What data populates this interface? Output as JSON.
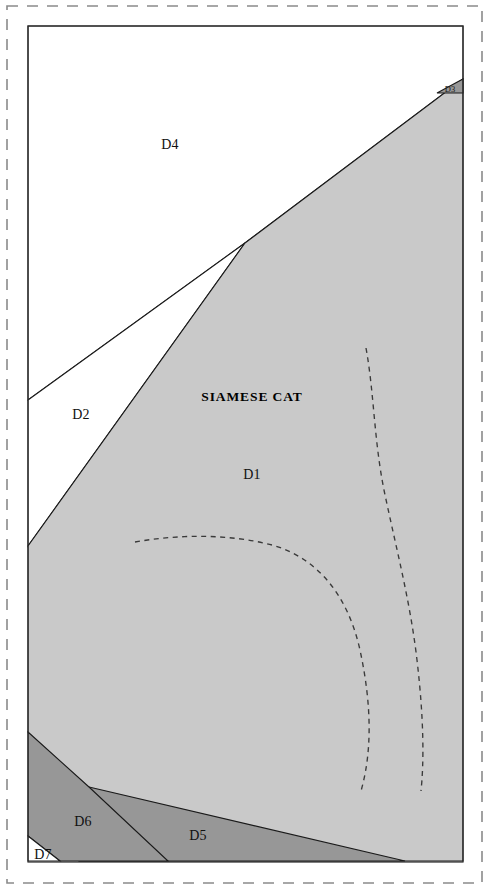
{
  "figure": {
    "title_text": "SIAMESE CAT",
    "colors": {
      "page_background": "#ffffff",
      "region_light_gray": "#c9c9c9",
      "region_dark_gray": "#979797",
      "region_white": "#ffffff",
      "line_stroke": "#1a1a1a",
      "dashed_contour": "#3a3a3a",
      "outer_border": "#8a8a8a",
      "inner_frame": "#2b2b2b"
    },
    "frame": {
      "outer_dashed": {
        "x": 7,
        "y": 6,
        "width": 475,
        "height": 877
      },
      "inner_solid": {
        "x": 28,
        "y": 26,
        "width": 435,
        "height": 836
      }
    },
    "domains": [
      {
        "id": "D1",
        "label": "D1",
        "fill": "#c9c9c9",
        "label_x": 252,
        "label_y": 479,
        "points": "245,243 463,79 463,861 79,861 55,787 28,732 28,546"
      },
      {
        "id": "D2",
        "label": "D2",
        "fill": "#ffffff",
        "label_x": 81,
        "label_y": 419,
        "points": "245,243 28,546 28,400"
      },
      {
        "id": "D3",
        "label": "D3",
        "fill": "#979797",
        "label_x": 450,
        "label_y": 94,
        "points": "463,79 463,93 437,93"
      },
      {
        "id": "D4",
        "label": "D4",
        "fill": "#ffffff",
        "label_x": 170,
        "label_y": 149,
        "points": "28,26 463,26 463,79 245,243 28,400"
      },
      {
        "id": "D5",
        "label": "D5",
        "fill": "#979797",
        "label_x": 198,
        "label_y": 840,
        "points": "89,787 405,861 79,861"
      },
      {
        "id": "D6",
        "label": "D6",
        "fill": "#979797",
        "label_x": 83,
        "label_y": 826,
        "points": "28,732 89,787 168,861 60,861 28,836"
      },
      {
        "id": "D7",
        "label": "D7",
        "fill": "#ffffff",
        "label_x": 33,
        "label_y": 859,
        "points": "28,836 60,861 28,861"
      }
    ],
    "contours": [
      {
        "id": "contour-inner",
        "description": "inner dashed contour arc",
        "path": "M 135,542 C 180,534 230,534 272,545 C 318,558 348,596 360,650 C 372,706 372,752 361,791"
      },
      {
        "id": "contour-outer",
        "description": "outer dashed contour arc",
        "path": "M 366,348 C 374,392 374,440 384,490 C 396,548 410,600 417,660 C 424,720 424,762 421,791"
      }
    ]
  }
}
